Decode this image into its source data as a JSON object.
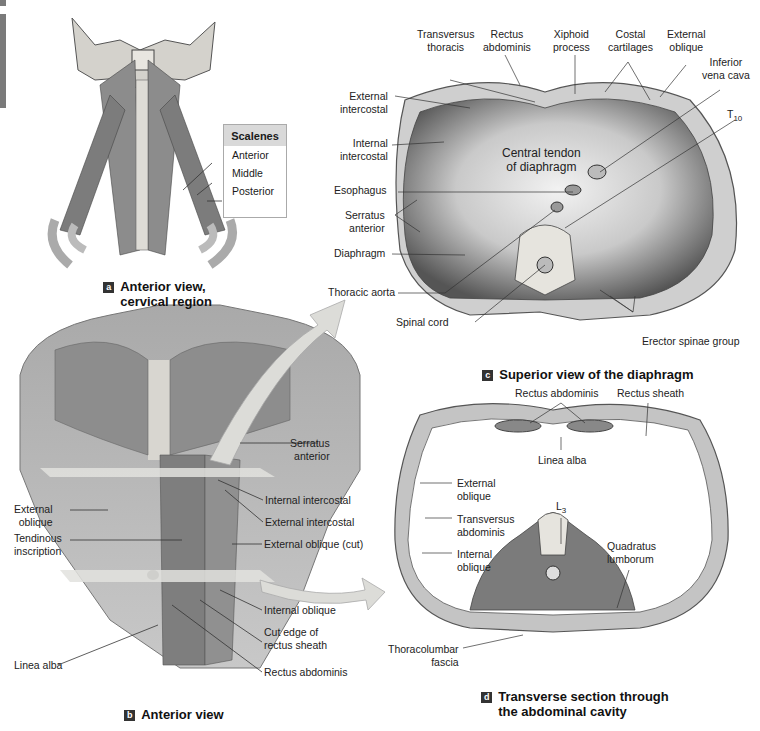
{
  "panels": {
    "a": {
      "badge": "a",
      "caption": "Anterior view,\ncervical region",
      "legend_title": "Scalenes",
      "legend_items": [
        "Anterior",
        "Middle",
        "Posterior"
      ]
    },
    "b": {
      "badge": "b",
      "caption": "Anterior view",
      "labels": {
        "serratus_anterior": "Serratus\nanterior",
        "external_oblique": "External\noblique",
        "internal_intercostal": "Internal intercostal",
        "external_intercostal": "External intercostal",
        "tendinous_inscription": "Tendinous\ninscription",
        "external_oblique_cut": "External oblique (cut)",
        "internal_oblique": "Internal oblique",
        "cut_edge": "Cut edge of\nrectus sheath",
        "linea_alba": "Linea alba",
        "rectus_abdominis": "Rectus abdominis"
      }
    },
    "c": {
      "badge": "c",
      "caption": "Superior view of the diaphragm",
      "labels": {
        "transversus_thoracis": "Transversus\nthoracis",
        "rectus_abdominis": "Rectus\nabdominis",
        "xiphoid_process": "Xiphoid\nprocess",
        "costal_cartilages": "Costal\ncartilages",
        "external_oblique": "External\noblique",
        "inferior_vena_cava": "Inferior\nvena cava",
        "external_intercostal": "External\nintercostal",
        "internal_intercostal": "Internal\nintercostal",
        "t10_main": "T",
        "t10_sub": "10",
        "central_tendon": "Central tendon\nof diaphragm",
        "esophagus": "Esophagus",
        "serratus_anterior": "Serratus\nanterior",
        "diaphragm": "Diaphragm",
        "thoracic_aorta": "Thoracic aorta",
        "spinal_cord": "Spinal cord",
        "erector_spinae": "Erector spinae group"
      }
    },
    "d": {
      "badge": "d",
      "caption": "Transverse section through\nthe abdominal cavity",
      "labels": {
        "rectus_abdominis": "Rectus abdominis",
        "rectus_sheath": "Rectus sheath",
        "linea_alba": "Linea alba",
        "external_oblique": "External\noblique",
        "l3_main": "L",
        "l3_sub": "3",
        "transversus_abdominis": "Transversus\nabdominis",
        "quadratus_lumborum": "Quadratus\nlumborum",
        "internal_oblique": "Internal\noblique",
        "thoracolumbar_fascia": "Thoracolumbar\nfascia"
      }
    }
  },
  "colors": {
    "muscle": "#8a8a8a",
    "muscle_dark": "#5e5e5e",
    "bone": "#e4e2dc",
    "arrow": "#d8d8d4",
    "badge": "#333333",
    "legend_header": "#d9d9d9"
  }
}
